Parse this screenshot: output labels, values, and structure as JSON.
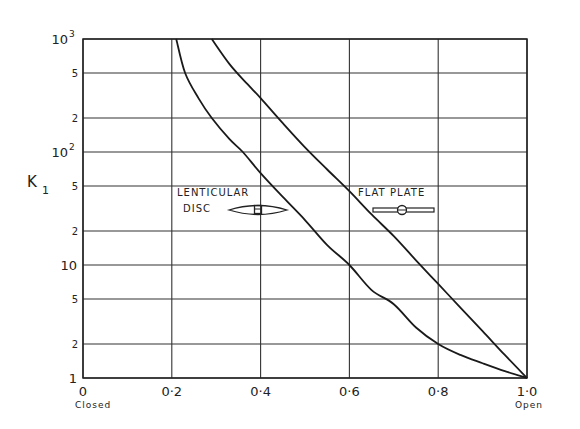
{
  "chart_data": {
    "type": "line",
    "title": "",
    "xlabel": "",
    "ylabel": "K1",
    "ylabel_main": "K",
    "ylabel_sub": "1",
    "xscale": "linear",
    "yscale": "log",
    "xlim": [
      0,
      1.0
    ],
    "ylim": [
      1,
      1000
    ],
    "grid": true,
    "x_ticks": [
      {
        "value": 0,
        "label": "0"
      },
      {
        "value": 0.2,
        "label": "0·2"
      },
      {
        "value": 0.4,
        "label": "0·4"
      },
      {
        "value": 0.6,
        "label": "0·6"
      },
      {
        "value": 0.8,
        "label": "0·8"
      },
      {
        "value": 1.0,
        "label": "1·0"
      }
    ],
    "x_end_labels": {
      "left": "Closed",
      "right": "Open"
    },
    "y_ticks": [
      {
        "value": 1,
        "label": "1",
        "major": true
      },
      {
        "value": 2,
        "label": "2",
        "major": false
      },
      {
        "value": 5,
        "label": "5",
        "major": false
      },
      {
        "value": 10,
        "label": "10",
        "major": true
      },
      {
        "value": 20,
        "label": "2",
        "major": false
      },
      {
        "value": 50,
        "label": "5",
        "major": false
      },
      {
        "value": 100,
        "label": "10",
        "sup": "2",
        "major": true
      },
      {
        "value": 200,
        "label": "2",
        "major": false
      },
      {
        "value": 500,
        "label": "5",
        "major": false
      },
      {
        "value": 1000,
        "label": "10",
        "sup": "3",
        "major": true
      }
    ],
    "series": [
      {
        "name": "Lenticular disc",
        "label_lines": [
          "LENTICULAR",
          "DISC"
        ],
        "x": [
          0.21,
          0.23,
          0.26,
          0.29,
          0.33,
          0.36,
          0.4,
          0.45,
          0.5,
          0.55,
          0.6,
          0.65,
          0.7,
          0.75,
          0.8,
          0.85,
          0.9,
          0.95,
          1.0
        ],
        "y": [
          1000,
          500,
          300,
          200,
          130,
          100,
          65,
          40,
          25,
          15,
          10,
          6,
          4.5,
          2.8,
          2.0,
          1.6,
          1.35,
          1.15,
          1.0
        ]
      },
      {
        "name": "Flat plate",
        "label_lines": [
          "FLAT PLATE"
        ],
        "x": [
          0.29,
          0.33,
          0.37,
          0.4,
          0.45,
          0.5,
          0.55,
          0.6,
          0.65,
          0.7,
          0.75,
          0.8,
          0.85,
          0.9,
          0.95,
          1.0
        ],
        "y": [
          1000,
          600,
          400,
          300,
          180,
          110,
          70,
          45,
          28,
          18,
          11,
          6.8,
          4.2,
          2.6,
          1.6,
          1.0
        ]
      }
    ],
    "annotations": [
      {
        "text": "LENTICULAR",
        "x": 0.27,
        "y": 40
      },
      {
        "text": "DISC",
        "x": 0.27,
        "y": 30
      },
      {
        "text": "FLAT PLATE",
        "x": 0.62,
        "y": 40
      }
    ]
  }
}
